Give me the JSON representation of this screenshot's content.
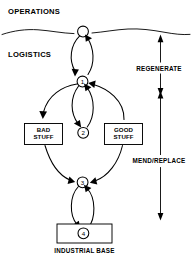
{
  "diagram": {
    "title_visible": false,
    "labels": {
      "operations": "OPERATIONS",
      "logistics": "LOGISTICS",
      "regenerate": "REGENERATE",
      "mend_replace": "MEND/REPLACE",
      "industrial_base": "INDUSTRIAL BASE"
    },
    "boxes": [
      {
        "id": "bad-stuff",
        "line1": "BAD",
        "line2": "STUFF"
      },
      {
        "id": "good-stuff",
        "line1": "GOOD",
        "line2": "STUFF"
      }
    ],
    "nodes": [
      {
        "id": "node-top",
        "label": ""
      },
      {
        "id": "node-1",
        "label": "1"
      },
      {
        "id": "node-2",
        "label": "2"
      },
      {
        "id": "node-3",
        "label": "3"
      },
      {
        "id": "node-4",
        "label": "4"
      }
    ],
    "colors": {
      "ink": "#000000",
      "paper": "#ffffff"
    }
  }
}
